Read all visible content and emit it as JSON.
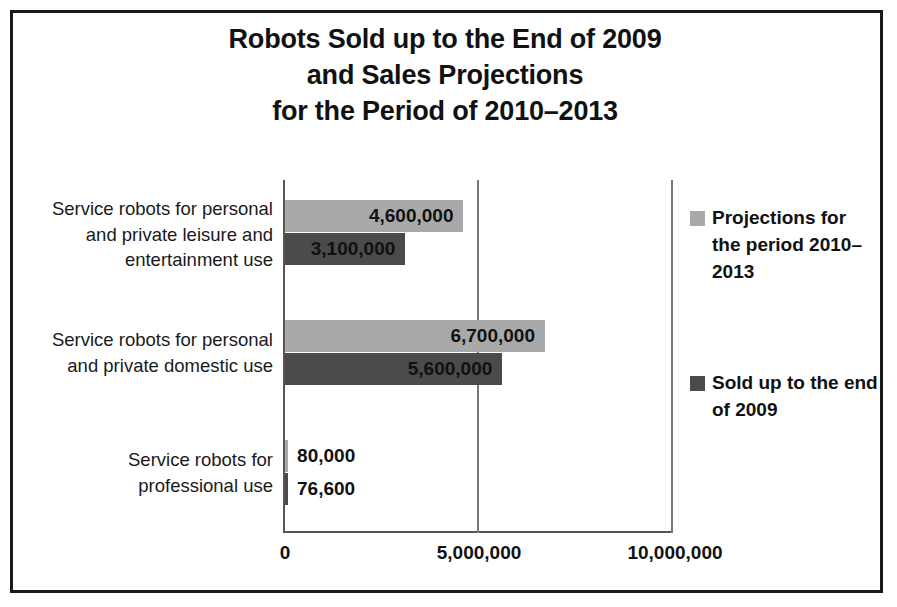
{
  "chart_data": {
    "type": "bar",
    "orientation": "horizontal",
    "title": "Robots Sold up to the End of 2009 and Sales Projections for the Period of 2010–2013",
    "title_lines": [
      "Robots Sold up to the End of 2009",
      "and Sales Projections",
      "for the Period of 2010–2013"
    ],
    "categories": [
      "Service robots for personal and private leisure and entertainment use",
      "Service robots for personal and private domestic use",
      "Service robots for professional use"
    ],
    "category_lines": [
      [
        "Service robots for personal",
        "and private leisure and",
        "entertainment use"
      ],
      [
        "Service robots for personal",
        "and private domestic use"
      ],
      [
        "Service robots for",
        "professional use"
      ]
    ],
    "series": [
      {
        "name": "Projections for the period 2010–2013",
        "name_lines": [
          "Projections for",
          "the period 2010–",
          "2013"
        ],
        "color": "#a9a9a9",
        "values": [
          4600000,
          6700000,
          80000
        ],
        "value_labels": [
          "4,600,000",
          "6,700,000",
          "80,000"
        ]
      },
      {
        "name": "Sold up to the end of 2009",
        "name_lines": [
          "Sold up to the end",
          "of 2009"
        ],
        "color": "#4b4b4b",
        "values": [
          3100000,
          5600000,
          76600
        ],
        "value_labels": [
          "3,100,000",
          "5,600,000",
          "76,600"
        ]
      }
    ],
    "xlabel": "",
    "ylabel": "",
    "xlim": [
      0,
      10000000
    ],
    "xticks": [
      0,
      5000000,
      10000000
    ],
    "xtick_labels": [
      "0",
      "5,000,000",
      "10,000,000"
    ],
    "grid": true,
    "legend_position": "right",
    "border_color": "#1a1a1a",
    "background": "#ffffff"
  }
}
